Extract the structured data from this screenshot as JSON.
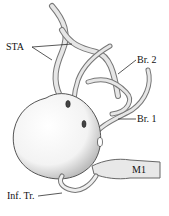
{
  "figure": {
    "labels": {
      "sta": "STA",
      "br2": "Br. 2",
      "br1": "Br. 1",
      "m1": "M1",
      "inf_tr": "Inf. Tr."
    }
  }
}
